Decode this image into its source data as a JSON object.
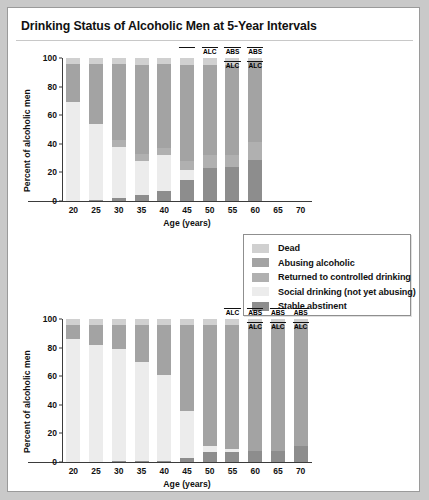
{
  "figure": {
    "title": "Drinking Status of Alcoholic Men at 5-Year Intervals",
    "background": "#ffffff",
    "border_color": "#9a9a9a"
  },
  "colors": {
    "dead": "#d0d0d0",
    "abusing_alcoholic": "#a3a3a3",
    "returned_controlled": "#b0b0b0",
    "social_drinking": "#ececec",
    "stable_abstinent": "#8d8d8d",
    "axis": "#3b3b3b",
    "text": "#111111"
  },
  "legend": {
    "position": "middle-right",
    "items": [
      {
        "label": "Dead",
        "color_key": "dead",
        "color": "#d0d0d0"
      },
      {
        "label": "Abusing alcoholic",
        "color_key": "abusing_alcoholic",
        "color": "#a3a3a3"
      },
      {
        "label": "Returned to controlled drinking",
        "color_key": "returned_controlled",
        "color": "#b0b0b0"
      },
      {
        "label": "Social drinking (not yet abusing)",
        "color_key": "social_drinking",
        "color": "#ececec"
      },
      {
        "label": "Stable abstinent",
        "color_key": "stable_abstinent",
        "color": "#8d8d8d"
      }
    ]
  },
  "chart_data": [
    {
      "id": "top-chart",
      "type": "bar",
      "stacked": true,
      "title": "",
      "xlabel": "Age (years)",
      "ylabel": "Percent of alcoholic men",
      "categories": [
        "20",
        "25",
        "30",
        "35",
        "40",
        "45",
        "50",
        "55",
        "60",
        "65",
        "70"
      ],
      "xticks": [
        "20",
        "25",
        "30",
        "35",
        "40",
        "45",
        "50",
        "55",
        "60",
        "65",
        "70"
      ],
      "yticks": [
        0,
        20,
        40,
        60,
        80,
        100
      ],
      "ylim": [
        0,
        100
      ],
      "grid": false,
      "series": [
        {
          "name": "Stable abstinent",
          "color": "#8d8d8d",
          "values": [
            0,
            1,
            2,
            4,
            7,
            15,
            23,
            24,
            29,
            null,
            null
          ]
        },
        {
          "name": "Social drinking (not yet abusing)",
          "color": "#ececec",
          "values": [
            69,
            53,
            36,
            24,
            25,
            7,
            0,
            0,
            0,
            null,
            null
          ]
        },
        {
          "name": "Returned to controlled drinking",
          "color": "#b0b0b0",
          "values": [
            0,
            0,
            5,
            5,
            5,
            6,
            9,
            8,
            12,
            null,
            null
          ]
        },
        {
          "name": "Abusing alcoholic",
          "color": "#a3a3a3",
          "values": [
            27,
            42,
            53,
            62,
            59,
            67,
            63,
            63,
            56,
            null,
            null
          ]
        },
        {
          "name": "Dead",
          "color": "#d0d0d0",
          "values": [
            4,
            4,
            4,
            5,
            4,
            5,
            5,
            5,
            3,
            null,
            null
          ]
        }
      ],
      "annotations": [
        {
          "category": "45",
          "lines": [],
          "rule": true
        },
        {
          "category": "50",
          "lines": [
            "ALC"
          ],
          "rule": true
        },
        {
          "category": "55",
          "lines": [
            "ABS",
            "ALC"
          ],
          "rule": true
        },
        {
          "category": "60",
          "lines": [
            "ABS",
            "ALC"
          ],
          "rule": true
        }
      ]
    },
    {
      "id": "bottom-chart",
      "type": "bar",
      "stacked": true,
      "title": "",
      "xlabel": "Age (years)",
      "ylabel": "Percent of alcoholic men",
      "categories": [
        "20",
        "25",
        "30",
        "35",
        "40",
        "45",
        "50",
        "55",
        "60",
        "65",
        "70"
      ],
      "xticks": [
        "20",
        "25",
        "30",
        "35",
        "40",
        "45",
        "50",
        "55",
        "60",
        "65",
        "70"
      ],
      "yticks": [
        0,
        20,
        40,
        60,
        80,
        100
      ],
      "ylim": [
        0,
        100
      ],
      "grid": false,
      "series": [
        {
          "name": "Stable abstinent",
          "color": "#8d8d8d",
          "values": [
            0,
            0,
            1,
            1,
            1,
            3,
            7,
            7,
            8,
            8,
            11
          ]
        },
        {
          "name": "Social drinking (not yet abusing)",
          "color": "#ececec",
          "values": [
            86,
            82,
            78,
            69,
            60,
            33,
            4,
            2,
            0,
            0,
            0
          ]
        },
        {
          "name": "Returned to controlled drinking",
          "color": "#b0b0b0",
          "values": [
            0,
            0,
            0,
            0,
            0,
            0,
            0,
            0,
            0,
            0,
            0
          ]
        },
        {
          "name": "Abusing alcoholic",
          "color": "#a3a3a3",
          "values": [
            10,
            14,
            17,
            26,
            35,
            60,
            85,
            87,
            88,
            88,
            85
          ]
        },
        {
          "name": "Dead",
          "color": "#d0d0d0",
          "values": [
            4,
            4,
            4,
            4,
            4,
            4,
            4,
            4,
            4,
            4,
            4
          ]
        }
      ],
      "annotations": [
        {
          "category": "55",
          "lines": [
            "ALC"
          ],
          "rule": true
        },
        {
          "category": "60",
          "lines": [
            "ABS",
            "ALC"
          ],
          "rule": true
        },
        {
          "category": "65",
          "lines": [
            "ABS",
            "ALC"
          ],
          "rule": true
        },
        {
          "category": "70",
          "lines": [
            "ABS",
            "ALC"
          ],
          "rule": true
        }
      ]
    }
  ]
}
